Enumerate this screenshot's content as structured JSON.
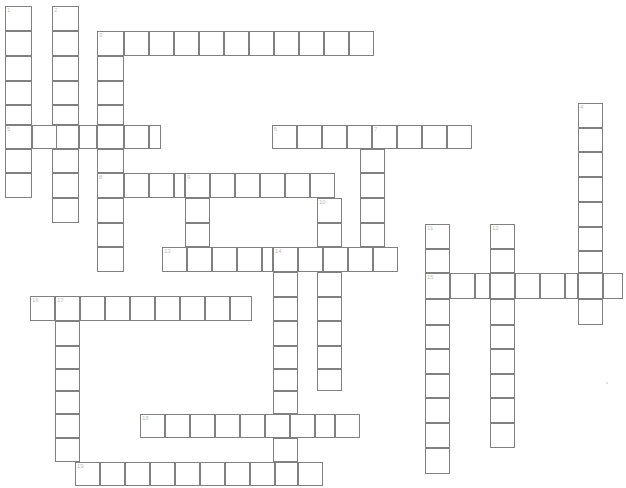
{
  "page": {
    "background_color": "#ffffff",
    "cell_border_color": "#808080",
    "cell_fill_color": "#ffffff",
    "clue_number_color": "#c0c0c0",
    "width": 626,
    "height": 488,
    "clipped_header_text": "•  •",
    "cell_width": 24.4,
    "cell_height": 24.5,
    "origin_x": 5,
    "origin_y": 6
  },
  "grid": {
    "columns": 25,
    "rows": 20,
    "numbered_clues_total": 19,
    "entries": [
      {
        "number": "1",
        "direction": "down",
        "col": 0,
        "row": 0,
        "length": 8
      },
      {
        "number": "2",
        "direction": "down",
        "col": 2,
        "row": 0,
        "length": 9
      },
      {
        "number": "3",
        "direction": "across",
        "col": 4,
        "row": 1,
        "length": 11
      },
      {
        "number": "3",
        "direction": "down",
        "col": 4,
        "row": 1,
        "length": 10
      },
      {
        "number": "4",
        "direction": "down",
        "col": 23,
        "row": 4,
        "length": 9
      },
      {
        "number": "5",
        "direction": "across",
        "col": 0,
        "row": 5,
        "length": 7
      },
      {
        "number": "6",
        "direction": "across",
        "col": 11,
        "row": 5,
        "length": 9
      },
      {
        "number": "7",
        "direction": "down",
        "col": 14,
        "row": 5,
        "length": 5
      },
      {
        "number": "8",
        "direction": "across",
        "col": 4,
        "row": 7,
        "length": 10
      },
      {
        "number": "9",
        "direction": "down",
        "col": 7,
        "row": 7,
        "length": 5
      },
      {
        "number": "10",
        "direction": "down",
        "col": 13,
        "row": 8,
        "length": 8
      },
      {
        "number": "11",
        "direction": "down",
        "col": 17,
        "row": 9,
        "length": 10
      },
      {
        "number": "12",
        "direction": "down",
        "col": 20,
        "row": 9,
        "length": 9
      },
      {
        "number": "13",
        "direction": "across",
        "col": 6,
        "row": 10,
        "length": 10
      },
      {
        "number": "14",
        "direction": "down",
        "col": 11,
        "row": 10,
        "length": 10
      },
      {
        "number": "15",
        "direction": "across",
        "col": 17,
        "row": 11,
        "length": 8
      },
      {
        "number": "16",
        "direction": "across",
        "col": 1,
        "row": 12,
        "length": 10
      },
      {
        "number": "17",
        "direction": "down",
        "col": 2,
        "row": 12,
        "length": 8
      },
      {
        "number": "18",
        "direction": "across",
        "col": 5,
        "row": 17,
        "length": 9
      },
      {
        "number": "19",
        "direction": "across",
        "col": 3,
        "row": 19,
        "length": 11
      }
    ],
    "cells": [
      {
        "x": 5,
        "y": 6,
        "w": 27,
        "h": 25,
        "num": "1"
      },
      {
        "x": 5,
        "y": 31,
        "w": 27,
        "h": 25,
        "num": ""
      },
      {
        "x": 5,
        "y": 56,
        "w": 27,
        "h": 25,
        "num": ""
      },
      {
        "x": 5,
        "y": 81,
        "w": 27,
        "h": 24,
        "num": ""
      },
      {
        "x": 5,
        "y": 105,
        "w": 27,
        "h": 20,
        "num": ""
      },
      {
        "x": 5,
        "y": 125,
        "w": 27,
        "h": 24,
        "num": "5"
      },
      {
        "x": 5,
        "y": 149,
        "w": 27,
        "h": 24,
        "num": ""
      },
      {
        "x": 5,
        "y": 173,
        "w": 27,
        "h": 25,
        "num": ""
      },
      {
        "x": 52,
        "y": 6,
        "w": 27,
        "h": 25,
        "num": "2"
      },
      {
        "x": 52,
        "y": 31,
        "w": 27,
        "h": 25,
        "num": ""
      },
      {
        "x": 52,
        "y": 56,
        "w": 27,
        "h": 25,
        "num": ""
      },
      {
        "x": 52,
        "y": 81,
        "w": 27,
        "h": 24,
        "num": ""
      },
      {
        "x": 52,
        "y": 105,
        "w": 27,
        "h": 20,
        "num": ""
      },
      {
        "x": 52,
        "y": 125,
        "w": 27,
        "h": 24,
        "num": ""
      },
      {
        "x": 52,
        "y": 149,
        "w": 27,
        "h": 24,
        "num": ""
      },
      {
        "x": 52,
        "y": 173,
        "w": 27,
        "h": 25,
        "num": ""
      },
      {
        "x": 52,
        "y": 198,
        "w": 27,
        "h": 25,
        "num": ""
      },
      {
        "x": 97,
        "y": 31,
        "w": 27,
        "h": 25,
        "num": "3"
      },
      {
        "x": 97,
        "y": 56,
        "w": 27,
        "h": 25,
        "num": ""
      },
      {
        "x": 97,
        "y": 81,
        "w": 27,
        "h": 24,
        "num": ""
      },
      {
        "x": 97,
        "y": 105,
        "w": 27,
        "h": 20,
        "num": ""
      },
      {
        "x": 97,
        "y": 125,
        "w": 27,
        "h": 24,
        "num": ""
      },
      {
        "x": 97,
        "y": 149,
        "w": 27,
        "h": 24,
        "num": ""
      },
      {
        "x": 97,
        "y": 173,
        "w": 27,
        "h": 25,
        "num": "8"
      },
      {
        "x": 97,
        "y": 198,
        "w": 27,
        "h": 25,
        "num": ""
      },
      {
        "x": 97,
        "y": 223,
        "w": 27,
        "h": 24,
        "num": ""
      },
      {
        "x": 97,
        "y": 247,
        "w": 27,
        "h": 25,
        "num": ""
      },
      {
        "x": 124,
        "y": 31,
        "w": 25,
        "h": 25,
        "num": ""
      },
      {
        "x": 149,
        "y": 31,
        "w": 25,
        "h": 25,
        "num": ""
      },
      {
        "x": 174,
        "y": 31,
        "w": 25,
        "h": 25,
        "num": ""
      },
      {
        "x": 199,
        "y": 31,
        "w": 25,
        "h": 25,
        "num": ""
      },
      {
        "x": 224,
        "y": 31,
        "w": 25,
        "h": 25,
        "num": ""
      },
      {
        "x": 249,
        "y": 31,
        "w": 25,
        "h": 25,
        "num": ""
      },
      {
        "x": 274,
        "y": 31,
        "w": 25,
        "h": 25,
        "num": ""
      },
      {
        "x": 299,
        "y": 31,
        "w": 25,
        "h": 25,
        "num": ""
      },
      {
        "x": 324,
        "y": 31,
        "w": 25,
        "h": 25,
        "num": ""
      },
      {
        "x": 349,
        "y": 31,
        "w": 25,
        "h": 25,
        "num": ""
      },
      {
        "x": 32,
        "y": 125,
        "w": 25,
        "h": 24,
        "num": ""
      },
      {
        "x": 79,
        "y": 125,
        "w": 18,
        "h": 24,
        "num": ""
      },
      {
        "x": 124,
        "y": 125,
        "w": 25,
        "h": 24,
        "num": ""
      },
      {
        "x": 149,
        "y": 125,
        "w": 12,
        "h": 24,
        "num": ""
      },
      {
        "x": 272,
        "y": 125,
        "w": 25,
        "h": 24,
        "num": "6"
      },
      {
        "x": 297,
        "y": 125,
        "w": 25,
        "h": 24,
        "num": ""
      },
      {
        "x": 322,
        "y": 125,
        "w": 25,
        "h": 24,
        "num": ""
      },
      {
        "x": 347,
        "y": 125,
        "w": 25,
        "h": 24,
        "num": ""
      },
      {
        "x": 372,
        "y": 125,
        "w": 25,
        "h": 24,
        "num": "7"
      },
      {
        "x": 397,
        "y": 125,
        "w": 25,
        "h": 24,
        "num": ""
      },
      {
        "x": 422,
        "y": 125,
        "w": 25,
        "h": 24,
        "num": ""
      },
      {
        "x": 447,
        "y": 125,
        "w": 25,
        "h": 24,
        "num": ""
      },
      {
        "x": 360,
        "y": 149,
        "w": 25,
        "h": 24,
        "num": ""
      },
      {
        "x": 360,
        "y": 173,
        "w": 25,
        "h": 25,
        "num": ""
      },
      {
        "x": 360,
        "y": 198,
        "w": 25,
        "h": 25,
        "num": ""
      },
      {
        "x": 360,
        "y": 223,
        "w": 25,
        "h": 24,
        "num": ""
      },
      {
        "x": 578,
        "y": 103,
        "w": 25,
        "h": 25,
        "num": "4"
      },
      {
        "x": 578,
        "y": 128,
        "w": 25,
        "h": 24,
        "num": ""
      },
      {
        "x": 578,
        "y": 152,
        "w": 25,
        "h": 25,
        "num": ""
      },
      {
        "x": 578,
        "y": 177,
        "w": 25,
        "h": 25,
        "num": ""
      },
      {
        "x": 578,
        "y": 202,
        "w": 25,
        "h": 25,
        "num": ""
      },
      {
        "x": 578,
        "y": 227,
        "w": 25,
        "h": 24,
        "num": ""
      },
      {
        "x": 578,
        "y": 251,
        "w": 25,
        "h": 22,
        "num": ""
      },
      {
        "x": 578,
        "y": 273,
        "w": 25,
        "h": 26,
        "num": ""
      },
      {
        "x": 578,
        "y": 299,
        "w": 25,
        "h": 26,
        "num": ""
      },
      {
        "x": 124,
        "y": 173,
        "w": 25,
        "h": 25,
        "num": ""
      },
      {
        "x": 149,
        "y": 173,
        "w": 25,
        "h": 25,
        "num": ""
      },
      {
        "x": 174,
        "y": 173,
        "w": 11,
        "h": 25,
        "num": ""
      },
      {
        "x": 185,
        "y": 173,
        "w": 25,
        "h": 25,
        "num": "9"
      },
      {
        "x": 210,
        "y": 173,
        "w": 25,
        "h": 25,
        "num": ""
      },
      {
        "x": 235,
        "y": 173,
        "w": 25,
        "h": 25,
        "num": ""
      },
      {
        "x": 260,
        "y": 173,
        "w": 25,
        "h": 25,
        "num": ""
      },
      {
        "x": 285,
        "y": 173,
        "w": 25,
        "h": 25,
        "num": ""
      },
      {
        "x": 310,
        "y": 173,
        "w": 25,
        "h": 25,
        "num": ""
      },
      {
        "x": 185,
        "y": 198,
        "w": 25,
        "h": 25,
        "num": ""
      },
      {
        "x": 185,
        "y": 223,
        "w": 25,
        "h": 24,
        "num": ""
      },
      {
        "x": 185,
        "y": 247,
        "w": 25,
        "h": 25,
        "num": ""
      },
      {
        "x": 317,
        "y": 198,
        "w": 25,
        "h": 25,
        "num": "10"
      },
      {
        "x": 317,
        "y": 223,
        "w": 25,
        "h": 24,
        "num": ""
      },
      {
        "x": 317,
        "y": 247,
        "w": 25,
        "h": 25,
        "num": ""
      },
      {
        "x": 317,
        "y": 272,
        "w": 25,
        "h": 25,
        "num": ""
      },
      {
        "x": 317,
        "y": 297,
        "w": 25,
        "h": 24,
        "num": ""
      },
      {
        "x": 317,
        "y": 321,
        "w": 25,
        "h": 25,
        "num": ""
      },
      {
        "x": 317,
        "y": 346,
        "w": 25,
        "h": 23,
        "num": ""
      },
      {
        "x": 317,
        "y": 369,
        "w": 25,
        "h": 22,
        "num": ""
      },
      {
        "x": 162,
        "y": 247,
        "w": 25,
        "h": 25,
        "num": "13"
      },
      {
        "x": 187,
        "y": 247,
        "w": 25,
        "h": 25,
        "num": ""
      },
      {
        "x": 212,
        "y": 247,
        "w": 25,
        "h": 25,
        "num": ""
      },
      {
        "x": 237,
        "y": 247,
        "w": 25,
        "h": 25,
        "num": ""
      },
      {
        "x": 262,
        "y": 247,
        "w": 11,
        "h": 25,
        "num": ""
      },
      {
        "x": 273,
        "y": 247,
        "w": 25,
        "h": 25,
        "num": "14"
      },
      {
        "x": 298,
        "y": 247,
        "w": 25,
        "h": 25,
        "num": ""
      },
      {
        "x": 323,
        "y": 247,
        "w": 25,
        "h": 25,
        "num": ""
      },
      {
        "x": 348,
        "y": 247,
        "w": 25,
        "h": 25,
        "num": ""
      },
      {
        "x": 373,
        "y": 247,
        "w": 25,
        "h": 25,
        "num": ""
      },
      {
        "x": 273,
        "y": 272,
        "w": 25,
        "h": 25,
        "num": ""
      },
      {
        "x": 273,
        "y": 297,
        "w": 25,
        "h": 24,
        "num": ""
      },
      {
        "x": 273,
        "y": 321,
        "w": 25,
        "h": 25,
        "num": ""
      },
      {
        "x": 273,
        "y": 346,
        "w": 25,
        "h": 23,
        "num": ""
      },
      {
        "x": 273,
        "y": 369,
        "w": 25,
        "h": 22,
        "num": ""
      },
      {
        "x": 273,
        "y": 391,
        "w": 25,
        "h": 23,
        "num": ""
      },
      {
        "x": 273,
        "y": 414,
        "w": 25,
        "h": 24,
        "num": ""
      },
      {
        "x": 273,
        "y": 438,
        "w": 25,
        "h": 24,
        "num": ""
      },
      {
        "x": 273,
        "y": 462,
        "w": 25,
        "h": 24,
        "num": ""
      },
      {
        "x": 425,
        "y": 224,
        "w": 25,
        "h": 25,
        "num": "11"
      },
      {
        "x": 425,
        "y": 249,
        "w": 25,
        "h": 24,
        "num": ""
      },
      {
        "x": 425,
        "y": 273,
        "w": 25,
        "h": 26,
        "num": "15"
      },
      {
        "x": 425,
        "y": 299,
        "w": 25,
        "h": 26,
        "num": ""
      },
      {
        "x": 425,
        "y": 325,
        "w": 25,
        "h": 24,
        "num": ""
      },
      {
        "x": 425,
        "y": 349,
        "w": 25,
        "h": 25,
        "num": ""
      },
      {
        "x": 425,
        "y": 374,
        "w": 25,
        "h": 24,
        "num": ""
      },
      {
        "x": 425,
        "y": 398,
        "w": 25,
        "h": 25,
        "num": ""
      },
      {
        "x": 425,
        "y": 423,
        "w": 25,
        "h": 25,
        "num": ""
      },
      {
        "x": 425,
        "y": 448,
        "w": 25,
        "h": 26,
        "num": ""
      },
      {
        "x": 490,
        "y": 224,
        "w": 25,
        "h": 25,
        "num": "12"
      },
      {
        "x": 490,
        "y": 249,
        "w": 25,
        "h": 24,
        "num": ""
      },
      {
        "x": 490,
        "y": 273,
        "w": 25,
        "h": 26,
        "num": ""
      },
      {
        "x": 490,
        "y": 299,
        "w": 25,
        "h": 26,
        "num": ""
      },
      {
        "x": 490,
        "y": 325,
        "w": 25,
        "h": 24,
        "num": ""
      },
      {
        "x": 490,
        "y": 349,
        "w": 25,
        "h": 25,
        "num": ""
      },
      {
        "x": 490,
        "y": 374,
        "w": 25,
        "h": 24,
        "num": ""
      },
      {
        "x": 490,
        "y": 398,
        "w": 25,
        "h": 25,
        "num": ""
      },
      {
        "x": 490,
        "y": 423,
        "w": 25,
        "h": 25,
        "num": ""
      },
      {
        "x": 450,
        "y": 273,
        "w": 25,
        "h": 26,
        "num": ""
      },
      {
        "x": 475,
        "y": 273,
        "w": 15,
        "h": 26,
        "num": ""
      },
      {
        "x": 515,
        "y": 273,
        "w": 25,
        "h": 26,
        "num": ""
      },
      {
        "x": 540,
        "y": 273,
        "w": 25,
        "h": 26,
        "num": ""
      },
      {
        "x": 565,
        "y": 273,
        "w": 13,
        "h": 26,
        "num": ""
      },
      {
        "x": 603,
        "y": 273,
        "w": 20,
        "h": 26,
        "num": ""
      },
      {
        "x": 30,
        "y": 296,
        "w": 25,
        "h": 25,
        "num": "16"
      },
      {
        "x": 55,
        "y": 296,
        "w": 25,
        "h": 25,
        "num": "17"
      },
      {
        "x": 80,
        "y": 296,
        "w": 25,
        "h": 25,
        "num": ""
      },
      {
        "x": 105,
        "y": 296,
        "w": 25,
        "h": 25,
        "num": ""
      },
      {
        "x": 130,
        "y": 296,
        "w": 25,
        "h": 25,
        "num": ""
      },
      {
        "x": 155,
        "y": 296,
        "w": 25,
        "h": 25,
        "num": ""
      },
      {
        "x": 180,
        "y": 296,
        "w": 25,
        "h": 25,
        "num": ""
      },
      {
        "x": 205,
        "y": 296,
        "w": 25,
        "h": 25,
        "num": ""
      },
      {
        "x": 230,
        "y": 296,
        "w": 22,
        "h": 25,
        "num": ""
      },
      {
        "x": 55,
        "y": 321,
        "w": 25,
        "h": 25,
        "num": ""
      },
      {
        "x": 55,
        "y": 346,
        "w": 25,
        "h": 23,
        "num": ""
      },
      {
        "x": 55,
        "y": 369,
        "w": 25,
        "h": 22,
        "num": ""
      },
      {
        "x": 55,
        "y": 391,
        "w": 25,
        "h": 23,
        "num": ""
      },
      {
        "x": 55,
        "y": 414,
        "w": 25,
        "h": 24,
        "num": ""
      },
      {
        "x": 55,
        "y": 438,
        "w": 25,
        "h": 24,
        "num": ""
      },
      {
        "x": 140,
        "y": 414,
        "w": 25,
        "h": 24,
        "num": "18"
      },
      {
        "x": 165,
        "y": 414,
        "w": 25,
        "h": 24,
        "num": ""
      },
      {
        "x": 190,
        "y": 414,
        "w": 25,
        "h": 24,
        "num": ""
      },
      {
        "x": 215,
        "y": 414,
        "w": 25,
        "h": 24,
        "num": ""
      },
      {
        "x": 240,
        "y": 414,
        "w": 25,
        "h": 24,
        "num": ""
      },
      {
        "x": 265,
        "y": 414,
        "w": 25,
        "h": 24,
        "num": ""
      },
      {
        "x": 290,
        "y": 414,
        "w": 25,
        "h": 24,
        "num": ""
      },
      {
        "x": 315,
        "y": 414,
        "w": 20,
        "h": 24,
        "num": ""
      },
      {
        "x": 335,
        "y": 414,
        "w": 25,
        "h": 24,
        "num": ""
      },
      {
        "x": 75,
        "y": 462,
        "w": 25,
        "h": 24,
        "num": "19"
      },
      {
        "x": 100,
        "y": 462,
        "w": 25,
        "h": 24,
        "num": ""
      },
      {
        "x": 125,
        "y": 462,
        "w": 25,
        "h": 24,
        "num": ""
      },
      {
        "x": 150,
        "y": 462,
        "w": 25,
        "h": 24,
        "num": ""
      },
      {
        "x": 175,
        "y": 462,
        "w": 25,
        "h": 24,
        "num": ""
      },
      {
        "x": 200,
        "y": 462,
        "w": 25,
        "h": 24,
        "num": ""
      },
      {
        "x": 225,
        "y": 462,
        "w": 25,
        "h": 24,
        "num": ""
      },
      {
        "x": 250,
        "y": 462,
        "w": 25,
        "h": 24,
        "num": ""
      },
      {
        "x": 275,
        "y": 462,
        "w": 23,
        "h": 24,
        "num": ""
      },
      {
        "x": 298,
        "y": 462,
        "w": 25,
        "h": 24,
        "num": ""
      }
    ],
    "watermark_dots": [
      {
        "x": 606,
        "y": 382
      }
    ]
  }
}
